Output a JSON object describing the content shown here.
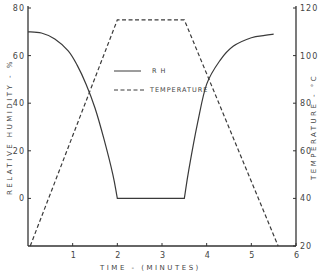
{
  "chart_data": {
    "type": "line",
    "title": "",
    "xlabel": "TIME - (MINUTES)",
    "ylabel_left": "RELATIVE HUMIDITY - %",
    "ylabel_right": "TEMPERATURE - °C",
    "xlim": [
      0,
      6
    ],
    "ylim_left": [
      -20,
      80
    ],
    "ylim_right": [
      20,
      120
    ],
    "x_ticks": [
      "1",
      "2",
      "3",
      "4",
      "5",
      "6"
    ],
    "y_ticks_left": [
      "80",
      "60",
      "40",
      "20",
      "0"
    ],
    "y_ticks_right": [
      "120",
      "100",
      "80",
      "60",
      "40",
      "20"
    ],
    "grid": false,
    "legend_position": "center-right inside plot",
    "series": [
      {
        "name": "R H",
        "axis": "left",
        "style": "solid",
        "x": [
          0.0,
          0.3,
          0.6,
          0.9,
          1.1,
          1.3,
          1.5,
          1.7,
          1.9,
          2.0,
          2.5,
          3.0,
          3.5,
          3.6,
          3.8,
          4.0,
          4.3,
          4.6,
          5.0,
          5.3,
          5.5
        ],
        "values": [
          70,
          69.5,
          67,
          62,
          56,
          48,
          38,
          25,
          10,
          0,
          0,
          0,
          0,
          12,
          32,
          48,
          58,
          64,
          67.5,
          68.5,
          69
        ]
      },
      {
        "name": "TEMPERATURE",
        "axis": "right",
        "style": "dashed",
        "x": [
          0.05,
          2.0,
          3.5,
          5.6
        ],
        "values": [
          20,
          115,
          115,
          20
        ]
      }
    ]
  },
  "legend": {
    "items": [
      {
        "label": "R H",
        "style": "solid"
      },
      {
        "label": "TEMPERATURE",
        "style": "dashed"
      }
    ]
  },
  "colors": {
    "line": "#3a3a3a",
    "axis": "#333333",
    "text": "#444444"
  }
}
